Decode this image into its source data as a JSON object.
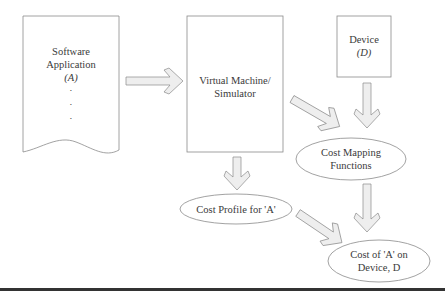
{
  "diagram": {
    "nodes": {
      "software_app": {
        "line1": "Software",
        "line2": "Application",
        "line3": "(A)",
        "dots": [
          "•",
          "•",
          "•"
        ],
        "shape": "document"
      },
      "virtual_machine": {
        "line1": "Virtual Machine/",
        "line2": "Simulator",
        "shape": "rectangle"
      },
      "device": {
        "line1": "Device",
        "line2": "(D)",
        "shape": "rectangle"
      },
      "cost_mapping": {
        "line1": "Cost Mapping",
        "line2": "Functions",
        "shape": "ellipse"
      },
      "cost_profile": {
        "line1": "Cost Profile for 'A'",
        "shape": "ellipse"
      },
      "cost_on_device": {
        "line1": "Cost of 'A' on",
        "line2": "Device, D",
        "shape": "ellipse"
      }
    },
    "edges": [
      {
        "from": "software_app",
        "to": "virtual_machine"
      },
      {
        "from": "virtual_machine",
        "to": "cost_mapping"
      },
      {
        "from": "device",
        "to": "cost_mapping"
      },
      {
        "from": "virtual_machine",
        "to": "cost_profile"
      },
      {
        "from": "cost_profile",
        "to": "cost_on_device"
      },
      {
        "from": "cost_mapping",
        "to": "cost_on_device"
      }
    ],
    "colors": {
      "stroke": "#8a8a8a",
      "arrow_fill": "#eeeeee",
      "rule": "#333333"
    }
  }
}
